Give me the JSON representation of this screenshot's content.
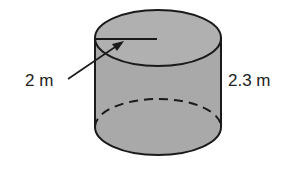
{
  "diagram": {
    "shape": "cylinder",
    "radius_label": "2 m",
    "height_label": "2.3 m",
    "fill_color": "#a9a9a9",
    "stroke_color": "#1a1a1a"
  }
}
